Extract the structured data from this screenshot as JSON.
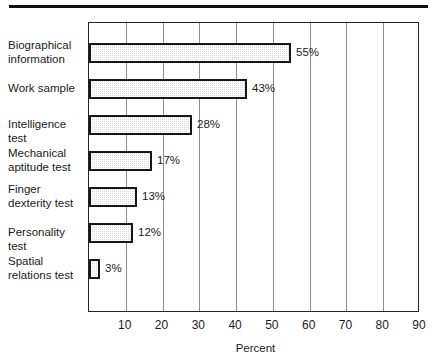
{
  "figure": {
    "top_rule": "horizontal-rule",
    "axis_title": "Percent"
  },
  "chart_data": {
    "type": "bar",
    "orientation": "horizontal",
    "title": "",
    "subtitle": "",
    "xlabel": "Percent",
    "ylabel": "",
    "xlim": [
      0,
      90
    ],
    "xticks": [
      10,
      20,
      30,
      40,
      50,
      60,
      70,
      80,
      90
    ],
    "xtick_labels": [
      "10",
      "20",
      "30",
      "40",
      "50",
      "60",
      "70",
      "80",
      "90"
    ],
    "grid": "vertical",
    "legend": "none",
    "value_label_suffix": "%",
    "categories": [
      "Biographical\ninformation",
      "Work sample",
      "Intelligence test",
      "Mechanical\naptitude test",
      "Finger\ndexterity test",
      "Personality test",
      "Spatial\nrelations test"
    ],
    "values": [
      55,
      43,
      28,
      17,
      13,
      12,
      3
    ],
    "value_labels": [
      "55%",
      "43%",
      "28%",
      "17%",
      "13%",
      "12%",
      "3%"
    ],
    "bar_fill_color": "#d9d9d9",
    "bar_edge_color": "#161616"
  }
}
